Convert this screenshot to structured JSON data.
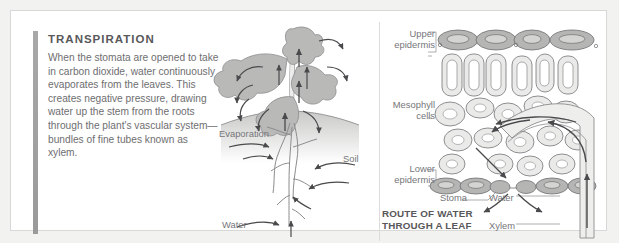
{
  "panel": {
    "heading": "TRANSPIRATION",
    "body": "When the stomata are opened to take in carbon dioxide, water continuously evaporates from the leaves. This creates negative pressure, drawing water up the stem from the roots through the plant's vascular system—bundles of fine tubes known as xylem."
  },
  "plant_diagram": {
    "evaporation_label": "Evaporation",
    "soil_label": "Soil",
    "water_label": "Water"
  },
  "leaf_diagram": {
    "upper_epidermis_label": "Upper\nepidermis",
    "upper_epidermis_line1": "Upper",
    "upper_epidermis_line2": "epidermis",
    "mesophyll_line1": "Mesophyll",
    "mesophyll_line2": "cells",
    "lower_epidermis_line1": "Lower",
    "lower_epidermis_line2": "epidermis",
    "stoma_label": "Stoma",
    "water_label": "Water",
    "xylem_label": "Xylem",
    "caption_line1": "ROUTE OF WATER",
    "caption_line2": "THROUGH A LEAF"
  },
  "colors": {
    "page_background": "#f2f2f0",
    "panel_background": "#ffffff",
    "panel_border": "#d8d8d6",
    "accent_bar": "#a8a8a8",
    "heading_text": "#58585a",
    "body_text": "#6e6e70",
    "label_text": "#76767a",
    "leaf_fill": "#b9b9b7",
    "cell_fill": "#e6e6e4",
    "epidermis_fill": "#b5b5b3",
    "arrow": "#4a4a4c"
  }
}
